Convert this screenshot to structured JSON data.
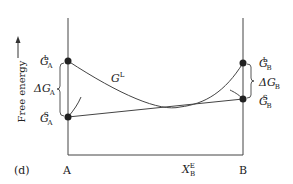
{
  "panel_label": "(d)",
  "y_axis": {
    "label": "Free energy",
    "arrow": "up-arrow"
  },
  "x_axis": {
    "left_label": "A",
    "right_label": "B",
    "marker_label": {
      "main": "X",
      "sub": "B",
      "sup": "E"
    }
  },
  "curves": {
    "liquid": {
      "main": "G",
      "sup": "L"
    }
  },
  "left_points": {
    "top": {
      "main": "G",
      "sub": "A",
      "sup": "L"
    },
    "bottom": {
      "main": "G",
      "sub": "A",
      "sup": "S"
    },
    "delta": {
      "main": "ΔG",
      "sub": "A"
    }
  },
  "right_points": {
    "top": {
      "main": "G",
      "sub": "B",
      "sup": "L"
    },
    "bottom": {
      "main": "G",
      "sub": "B",
      "sup": "S"
    },
    "delta": {
      "main": "ΔG",
      "sub": "B"
    }
  }
}
